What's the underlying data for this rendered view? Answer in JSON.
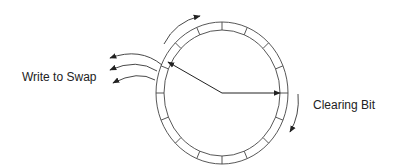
{
  "diagram": {
    "labels": {
      "write_to_swap": "Write to Swap",
      "clearing_bit": "Clearing Bit"
    },
    "ring_segments": 16,
    "hands": [
      {
        "name": "swap-hand",
        "direction": "upper-left"
      },
      {
        "name": "clear-hand",
        "direction": "right"
      }
    ],
    "colors": {
      "stroke": "#333333",
      "text": "#222222",
      "background": "#ffffff"
    }
  }
}
